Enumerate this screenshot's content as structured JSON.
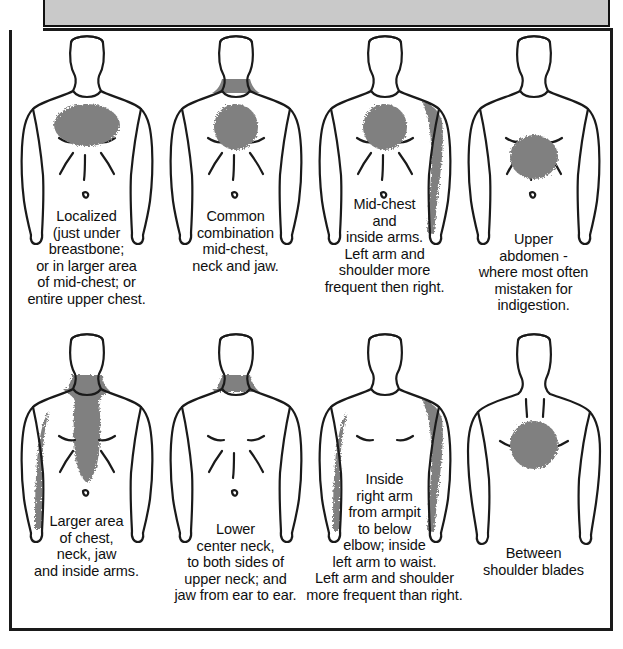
{
  "document": {
    "kind": "medical-illustration",
    "subject": "Locations of heart attack / angina pain",
    "header_bar_color": "#c9c9c9",
    "shading_color": "#808080",
    "outline_color": "#1a1a1a",
    "background_color": "#ffffff"
  },
  "figures": [
    {
      "id": "figure-1",
      "view": "front",
      "row": 1,
      "column": 1,
      "shaded_regions": [
        "mid-chest wide oval"
      ],
      "caption_lines": [
        "Localized",
        "(just under",
        "breastbone;",
        "or in larger area",
        "of mid-chest; or",
        "entire upper chest."
      ]
    },
    {
      "id": "figure-2",
      "view": "front",
      "row": 1,
      "column": 2,
      "shaded_regions": [
        "lower neck band",
        "mid-chest round patch"
      ],
      "caption_lines": [
        "Common",
        "combination",
        "mid-chest,",
        "neck and jaw."
      ]
    },
    {
      "id": "figure-3",
      "view": "front",
      "row": 1,
      "column": 3,
      "shaded_regions": [
        "mid-chest round patch",
        "left shoulder and inner left arm"
      ],
      "caption_lines": [
        "Mid-chest",
        "and",
        "inside arms.",
        "Left arm and",
        "shoulder more",
        "frequent then right."
      ]
    },
    {
      "id": "figure-4",
      "view": "front",
      "row": 1,
      "column": 4,
      "shaded_regions": [
        "upper abdomen round patch"
      ],
      "caption_lines": [
        "Upper",
        "abdomen -",
        "where most often",
        "mistaken for",
        "indigestion."
      ]
    },
    {
      "id": "figure-5",
      "view": "front",
      "row": 2,
      "column": 1,
      "shaded_regions": [
        "neck and jaw",
        "central chest column",
        "inner right arm"
      ],
      "caption_lines": [
        "Larger area",
        "of chest,",
        "neck, jaw",
        "and inside arms."
      ]
    },
    {
      "id": "figure-6",
      "view": "front",
      "row": 2,
      "column": 2,
      "shaded_regions": [
        "lower center neck band"
      ],
      "caption_lines": [
        "Lower",
        "center neck,",
        "to both sides of",
        "upper neck; and",
        "jaw from ear to ear."
      ]
    },
    {
      "id": "figure-7",
      "view": "front",
      "row": 2,
      "column": 3,
      "shaded_regions": [
        "inner right arm armpit to below elbow",
        "left shoulder and inner left arm to waist"
      ],
      "caption_lines": [
        "Inside",
        "right arm",
        "from armpit",
        "to below",
        "elbow; inside",
        "left arm to waist.",
        "Left arm and shoulder",
        "more frequent than right."
      ]
    },
    {
      "id": "figure-8",
      "view": "back",
      "row": 2,
      "column": 4,
      "shaded_regions": [
        "between shoulder blades round patch"
      ],
      "caption_lines": [
        "Between",
        "shoulder blades"
      ]
    }
  ]
}
